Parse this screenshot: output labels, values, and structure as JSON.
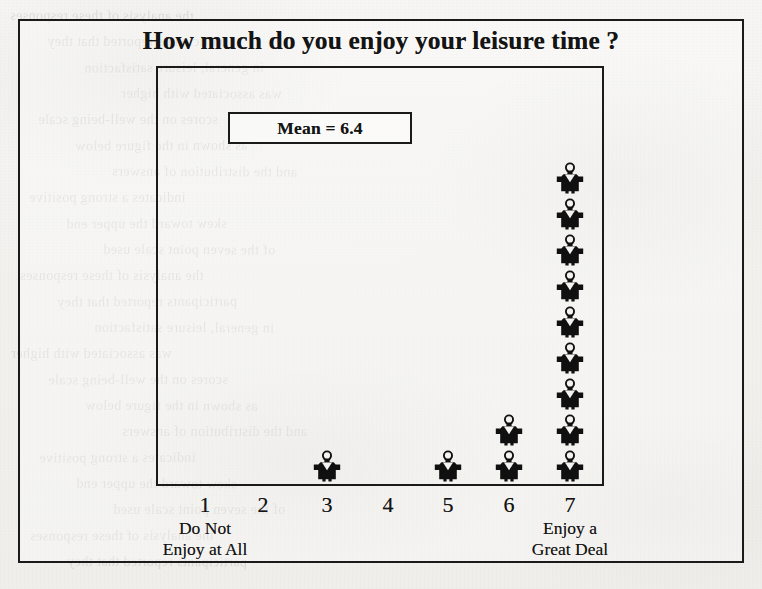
{
  "chart_data": {
    "type": "bar",
    "subtype": "pictograph",
    "title": "How much do you enjoy your leisure time ?",
    "xlabel": "",
    "ylabel": "",
    "categories": [
      "1",
      "2",
      "3",
      "4",
      "5",
      "6",
      "7"
    ],
    "values": [
      0,
      0,
      1,
      0,
      1,
      2,
      9
    ],
    "unit_note": "each icon represents one respondent",
    "icon": "person-icon",
    "annotations": [
      {
        "id": "mean",
        "label": "Mean = 6.4",
        "value": 6.4
      }
    ],
    "axis_endpoint_captions": {
      "left": [
        "Do Not",
        "Enjoy at All"
      ],
      "right": [
        "Enjoy a",
        "Great Deal"
      ]
    },
    "grid": false,
    "legend": null,
    "ylim": [
      0,
      9
    ]
  },
  "chart": {
    "title": "How much do you enjoy your leisure time ?",
    "mean_label": "Mean = 6.4",
    "ticks": [
      {
        "label": "1",
        "count": 0
      },
      {
        "label": "2",
        "count": 0
      },
      {
        "label": "3",
        "count": 1
      },
      {
        "label": "4",
        "count": 0
      },
      {
        "label": "5",
        "count": 1
      },
      {
        "label": "6",
        "count": 2
      },
      {
        "label": "7",
        "count": 9
      }
    ],
    "caption_left": {
      "line1": "Do Not",
      "line2": "Enjoy at All"
    },
    "caption_right": {
      "line1": "Enjoy a",
      "line2": "Great Deal"
    },
    "colors": {
      "ink": "#1a1a1a",
      "paper": "#f4f3f1",
      "icon_fill": "#101010"
    }
  },
  "page": {
    "ghost_lines": [
      "the analysis of these responses",
      "participants reported that they",
      "in general, leisure satisfaction",
      "was associated with higher",
      "scores on the well-being scale",
      "as shown in the figure below",
      "and the distribution of answers",
      "indicates a strong positive",
      "skew toward the upper end",
      "of the seven point scale used"
    ]
  }
}
